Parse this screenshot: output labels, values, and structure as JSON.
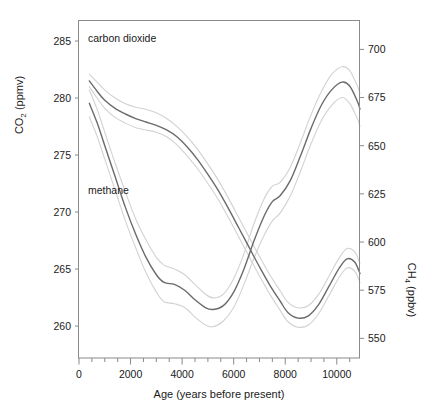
{
  "chart_data": {
    "type": "line",
    "title": "",
    "xlabel": "Age (years before present)",
    "xlim": [
      0,
      10900
    ],
    "xticks": [
      0,
      2000,
      4000,
      6000,
      8000,
      10000
    ],
    "xticklabels": [
      "0",
      "2000",
      "4000",
      "6000",
      "8000",
      "10000"
    ],
    "xminor_step": 500,
    "grid": false,
    "legend_position": "inline-annotations",
    "axes": [
      {
        "id": "left",
        "label": "CO2 (ppmv)",
        "label_parts": {
          "base1": "CO",
          "sub": "2",
          "base2": " (ppmv)"
        },
        "lim": [
          257.2,
          286.8
        ],
        "ticks": [
          260,
          265,
          270,
          275,
          280,
          285
        ],
        "ticklabels": [
          "260",
          "265",
          "270",
          "275",
          "280",
          "285"
        ]
      },
      {
        "id": "right",
        "label": "CH4 (ppbv)",
        "label_parts": {
          "base1": "CH",
          "sub": "4",
          "base2": " (ppbv)"
        },
        "lim": [
          539.8,
          715.0
        ],
        "ticks": [
          550,
          575,
          600,
          625,
          650,
          675,
          700
        ],
        "ticklabels": [
          "550",
          "575",
          "600",
          "625",
          "650",
          "675",
          "700"
        ]
      }
    ],
    "series": [
      {
        "name": "carbon dioxide",
        "annotation": "carbon dioxide",
        "axis": "left",
        "color": "#6b6b6b",
        "band_color": "#d2d2d2",
        "x": [
          400,
          700,
          1000,
          1400,
          1800,
          2200,
          2600,
          3000,
          3400,
          3800,
          4200,
          4600,
          5000,
          5400,
          5800,
          6200,
          6600,
          7000,
          7400,
          7800,
          8100,
          8500,
          8900,
          9300,
          9700,
          10100,
          10400,
          10700,
          10900
        ],
        "values": [
          281.5,
          280.6,
          279.8,
          279.1,
          278.6,
          278.2,
          277.9,
          277.6,
          277.2,
          276.6,
          275.7,
          274.6,
          273.3,
          271.9,
          270.3,
          268.6,
          266.9,
          265.2,
          263.6,
          262.2,
          261.2,
          260.7,
          260.9,
          261.9,
          263.5,
          265.1,
          265.9,
          265.6,
          264.6
        ],
        "upper": [
          282.1,
          281.4,
          280.7,
          280.0,
          279.5,
          279.2,
          279.0,
          278.7,
          278.2,
          277.5,
          276.6,
          275.5,
          274.2,
          272.8,
          271.2,
          269.5,
          267.8,
          266.1,
          264.5,
          263.1,
          262.1,
          261.6,
          261.8,
          262.8,
          264.4,
          266.0,
          266.8,
          266.5,
          265.5
        ],
        "lower": [
          281.0,
          280.0,
          279.1,
          278.3,
          277.8,
          277.4,
          277.2,
          277.0,
          276.6,
          275.9,
          274.9,
          273.8,
          272.5,
          271.1,
          269.5,
          267.8,
          266.1,
          264.4,
          262.8,
          261.4,
          260.4,
          259.9,
          260.1,
          261.1,
          262.7,
          264.3,
          265.1,
          264.8,
          263.8
        ]
      },
      {
        "name": "methane",
        "annotation": "methane",
        "axis": "right",
        "color": "#6b6b6b",
        "band_color": "#d2d2d2",
        "x": [
          400,
          700,
          1000,
          1400,
          1800,
          2200,
          2600,
          3000,
          3300,
          3700,
          4100,
          4500,
          4900,
          5200,
          5600,
          6000,
          6400,
          6800,
          7200,
          7500,
          7800,
          8200,
          8600,
          9000,
          9400,
          9800,
          10200,
          10500,
          10800,
          10900
        ],
        "values": [
          672,
          662,
          650,
          634,
          618,
          604,
          592,
          583,
          579,
          578,
          575,
          570,
          566,
          565,
          567,
          574,
          586,
          601,
          614,
          621,
          624,
          632,
          645,
          659,
          671,
          679,
          683,
          681,
          673,
          669
        ],
        "upper": [
          679,
          669,
          657,
          641,
          626,
          612,
          601,
          592,
          588,
          586,
          583,
          578,
          573,
          571,
          573,
          581,
          594,
          610,
          623,
          629,
          631,
          639,
          652,
          666,
          678,
          687,
          691,
          689,
          681,
          677
        ],
        "lower": [
          665,
          655,
          643,
          627,
          611,
          597,
          584,
          574,
          569,
          568,
          566,
          561,
          557,
          556,
          559,
          566,
          578,
          592,
          604,
          611,
          615,
          624,
          637,
          651,
          663,
          671,
          675,
          672,
          664,
          660
        ]
      }
    ]
  },
  "figure": {
    "background_color": "#ffffff",
    "frame_color": "#8a8a8a",
    "text_color": "#1a1a1a"
  }
}
